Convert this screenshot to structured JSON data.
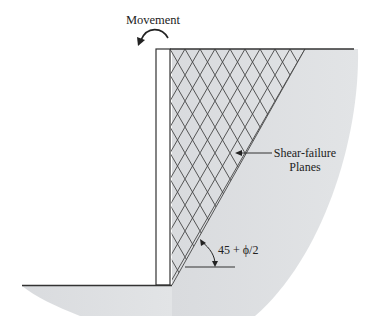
{
  "diagram": {
    "labels": {
      "movement": "Movement",
      "shear_line1": "Shear-failure",
      "shear_line2": "Planes",
      "angle": "45 + ϕ/2"
    },
    "colors": {
      "soil_fill": "#dcdee0",
      "line": "#333333",
      "wall_fill": "#ffffff"
    },
    "icons": {
      "movement_arrow": "curved-arrow-left",
      "leader_arrow": "arrow-left",
      "angle_arc": "angle-arc"
    }
  }
}
